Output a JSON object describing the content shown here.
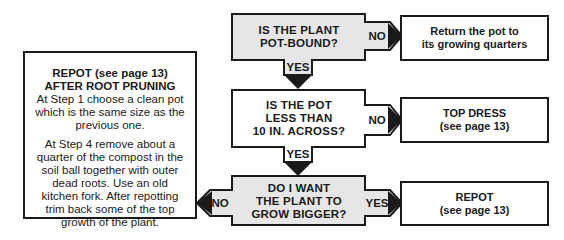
{
  "colors": {
    "stroke": "#1a1a1a",
    "decision_fill_gray": "#e6e6e6",
    "decision_fill_white": "#ffffff"
  },
  "decisions": [
    {
      "lines": [
        "IS THE PLANT",
        "POT-BOUND?"
      ],
      "no_label": "NO",
      "yes_label": "YES"
    },
    {
      "lines": [
        "IS THE POT",
        "LESS THAN",
        "10 IN. ACROSS?"
      ],
      "no_label": "NO",
      "yes_label": "YES"
    },
    {
      "lines": [
        "DO I WANT",
        "THE PLANT TO",
        "GROW BIGGER?"
      ],
      "no_label": "NO",
      "yes_label": "YES"
    }
  ],
  "results": [
    {
      "lines": [
        "Return the pot to",
        "its growing quarters"
      ]
    },
    {
      "title": "TOP DRESS",
      "sub": "(see page 13)"
    },
    {
      "title": "REPOT",
      "sub": "(see page 13)"
    }
  ],
  "left_box": {
    "title1": "REPOT (see page 13)",
    "title2": "AFTER ROOT PRUNING",
    "para1": "At Step 1 choose a clean pot which is the same size as the previous one.",
    "para2": "At Step 4 remove about a quarter of the compost in the soil ball together with outer dead roots. Use an old kitchen fork. After repotting trim back some of the top growth of the plant."
  }
}
